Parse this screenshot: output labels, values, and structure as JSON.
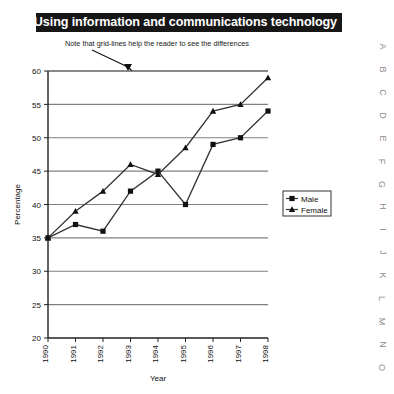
{
  "title": {
    "text": "Using information and communications technology",
    "banner_color": "#161616",
    "text_color": "#ffffff"
  },
  "annotation": {
    "note": "Note that grid-lines help the reader to see the differences",
    "arrow": "arrow-pointing-to-gridline"
  },
  "legend": {
    "entries": [
      {
        "label": "Male",
        "marker": "square"
      },
      {
        "label": "Female",
        "marker": "triangle"
      }
    ]
  },
  "axes": {
    "ylabel": "Percentage",
    "xlabel": "Year",
    "ytick_labels": [
      "20",
      "25",
      "30",
      "35",
      "40",
      "45",
      "50",
      "55",
      "60"
    ],
    "xtick_labels": [
      "1990",
      "1991",
      "1992",
      "1993",
      "1994",
      "1995",
      "1996",
      "1997",
      "1998"
    ]
  },
  "margin_letters": [
    "A",
    "B",
    "C",
    "D",
    "E",
    "F",
    "G",
    "H",
    "I",
    "J",
    "K",
    "L",
    "M",
    "N",
    "O"
  ],
  "chart_data": {
    "type": "line",
    "title": "Using information and communications technology",
    "xlabel": "Year",
    "ylabel": "Percentage",
    "categories": [
      "1990",
      "1991",
      "1992",
      "1993",
      "1994",
      "1995",
      "1996",
      "1997",
      "1998"
    ],
    "series": [
      {
        "name": "Male",
        "marker": "square",
        "values": [
          35,
          37,
          36,
          42,
          45,
          40,
          49,
          50,
          54
        ]
      },
      {
        "name": "Female",
        "marker": "triangle",
        "values": [
          35,
          39,
          42,
          46,
          44.5,
          48.5,
          54,
          55,
          59
        ]
      }
    ],
    "ylim": [
      20,
      60
    ],
    "ytick_step": 5,
    "grid": true,
    "grid_axis": "y",
    "legend_position": "right-middle",
    "line_color": "#333333",
    "grid_color": "#808080"
  }
}
